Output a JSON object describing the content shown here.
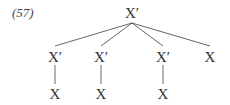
{
  "example_number": "(57)",
  "tree": {
    "root": {
      "label": "X′",
      "x": 132,
      "y": 6
    },
    "children": [
      {
        "label": "X′",
        "x": 55,
        "y": 50,
        "child": {
          "label": "X",
          "x": 55,
          "y": 87
        }
      },
      {
        "label": "X′",
        "x": 101,
        "y": 50,
        "child": {
          "label": "X",
          "x": 101,
          "y": 87
        }
      },
      {
        "label": "X′",
        "x": 163,
        "y": 50,
        "child": {
          "label": "X",
          "x": 163,
          "y": 87
        }
      },
      {
        "label": "X",
        "x": 210,
        "y": 50
      }
    ]
  }
}
